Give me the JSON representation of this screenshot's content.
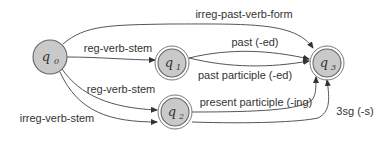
{
  "diagram": {
    "type": "finite-state-automaton",
    "states": [
      {
        "id": "q0",
        "base": "q",
        "sub": "0",
        "accepting": false,
        "x": 50,
        "y": 57
      },
      {
        "id": "q1",
        "base": "q",
        "sub": "1",
        "accepting": true,
        "x": 172,
        "y": 63
      },
      {
        "id": "q2",
        "base": "q",
        "sub": "2",
        "accepting": true,
        "x": 175,
        "y": 112
      },
      {
        "id": "q3",
        "base": "q",
        "sub": "3",
        "accepting": true,
        "x": 327,
        "y": 63
      }
    ],
    "edges": [
      {
        "from": "q0",
        "to": "q3",
        "label": "irreg-past-verb-form"
      },
      {
        "from": "q0",
        "to": "q1",
        "label": "reg-verb-stem"
      },
      {
        "from": "q0",
        "to": "q2",
        "label": "reg-verb-stem"
      },
      {
        "from": "q0",
        "to": "q2",
        "label": "irreg-verb-stem"
      },
      {
        "from": "q1",
        "to": "q3",
        "label": "past (-ed)"
      },
      {
        "from": "q1",
        "to": "q3",
        "label": "past participle (-ed)"
      },
      {
        "from": "q2",
        "to": "q3",
        "label": "present participle (-ing)"
      },
      {
        "from": "q2",
        "to": "q3",
        "label": "3sg (-s)"
      }
    ],
    "colors": {
      "node_fill": "#c9c9c9",
      "stroke": "#555555",
      "text": "#333333"
    }
  }
}
